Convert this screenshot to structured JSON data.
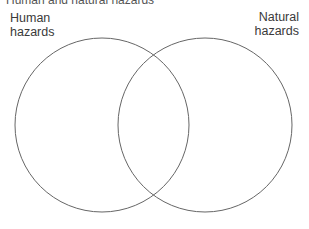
{
  "title": "Human and natural hazards",
  "diagram": {
    "type": "venn",
    "sets": [
      {
        "label_line1": "Human",
        "label_line2": "hazards"
      },
      {
        "label_line1": "Natural",
        "label_line2": "hazards"
      }
    ],
    "stroke_color": "#555555"
  }
}
